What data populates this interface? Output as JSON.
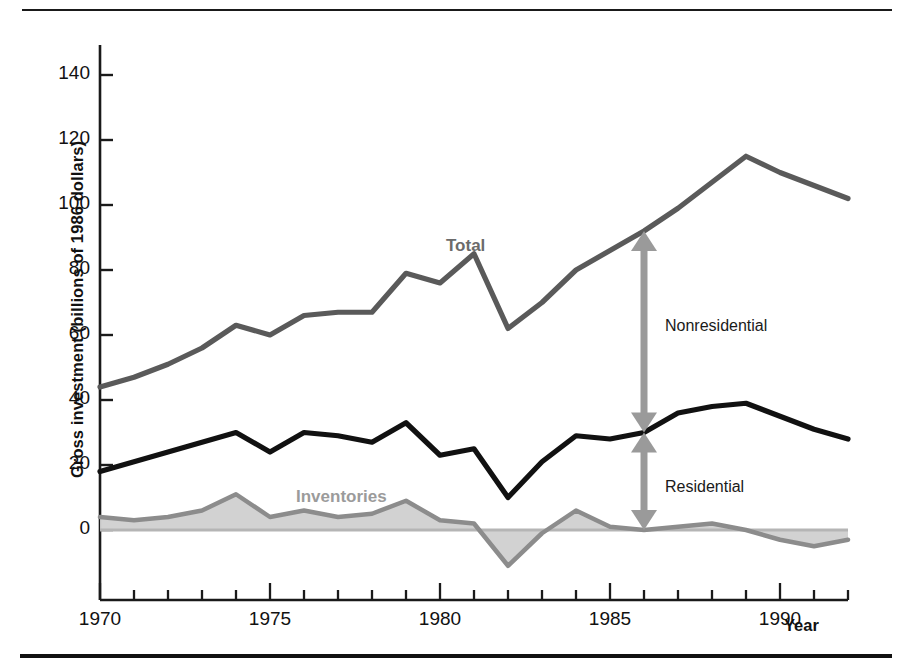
{
  "figure": {
    "y_axis_title": "Gross investment (billions of 1986 dollars)",
    "x_axis_title": "Year"
  },
  "series_labels": {
    "total": "Total",
    "inventories": "Inventories"
  },
  "annotations": {
    "nonresidential": "Nonresidential",
    "residential": "Residential"
  },
  "colors": {
    "total_line": "#5a5a5a",
    "residential_line": "#111111",
    "inventories_line": "#8c8c8c",
    "inventories_fill": "#d0d0d0",
    "arrow": "#9a9a9a",
    "axis": "#1a1a1a",
    "text": "#111111",
    "total_label": "#6b6b6b",
    "inventories_label": "#9b9b9b"
  },
  "chart_data": {
    "type": "line",
    "title": "",
    "xlabel": "Year",
    "ylabel": "Gross investment (billions of 1986 dollars)",
    "xlim": [
      1970,
      1992
    ],
    "ylim": [
      -15,
      150
    ],
    "xticks": [
      1970,
      1975,
      1980,
      1985,
      1990
    ],
    "xtick_labels": [
      "1970",
      "1975",
      "1980",
      "1985",
      "1990"
    ],
    "minor_xtick_interval": 1,
    "yticks": [
      0,
      20,
      40,
      60,
      80,
      100,
      120,
      140
    ],
    "ytick_labels": [
      "0",
      "20",
      "40",
      "60",
      "80",
      "100",
      "120",
      "140"
    ],
    "grid": false,
    "legend": "inline-labels",
    "x": [
      1970,
      1971,
      1972,
      1973,
      1974,
      1975,
      1976,
      1977,
      1978,
      1979,
      1980,
      1981,
      1982,
      1983,
      1984,
      1985,
      1986,
      1987,
      1988,
      1989,
      1990,
      1991,
      1992
    ],
    "series": [
      {
        "name": "Total",
        "color": "#5a5a5a",
        "values": [
          44,
          47,
          51,
          56,
          63,
          60,
          66,
          67,
          67,
          79,
          76,
          85,
          62,
          70,
          80,
          86,
          92,
          99,
          107,
          115,
          110,
          106,
          102
        ]
      },
      {
        "name": "Residential",
        "color": "#111111",
        "values": [
          18,
          21,
          24,
          27,
          30,
          24,
          30,
          29,
          27,
          33,
          23,
          25,
          10,
          21,
          29,
          28,
          30,
          36,
          38,
          39,
          35,
          31,
          28
        ]
      },
      {
        "name": "Inventories",
        "color": "#8c8c8c",
        "values": [
          4,
          3,
          4,
          6,
          11,
          4,
          6,
          4,
          5,
          9,
          3,
          2,
          -11,
          -1,
          6,
          1,
          0,
          1,
          2,
          0,
          -3,
          -5,
          -3
        ]
      }
    ],
    "annotations": [
      {
        "label": "Nonresidential",
        "type": "double-arrow",
        "x": 1986,
        "y_from": 30,
        "y_to": 92,
        "note": "gap between Residential line and Total line"
      },
      {
        "label": "Residential",
        "type": "double-arrow",
        "x": 1986,
        "y_from": 0,
        "y_to": 30,
        "note": "gap between Inventories line and Residential line"
      }
    ]
  }
}
